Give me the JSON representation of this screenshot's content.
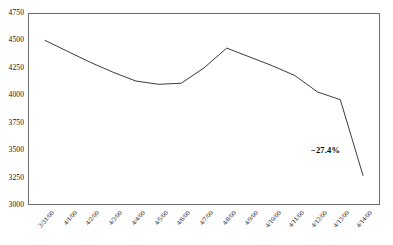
{
  "chart_data": {
    "type": "line",
    "title": "",
    "xlabel": "",
    "ylabel": "",
    "categories": [
      "3/31/00",
      "4/1/00",
      "4/2/00",
      "4/3/00",
      "4/4/00",
      "4/5/00",
      "4/6/00",
      "4/7/00",
      "4/8/00",
      "4/9/00",
      "4/10/00",
      "4/11/00",
      "4/12/00",
      "4/13/00",
      "4/14/00"
    ],
    "values": [
      4500,
      4400,
      4300,
      4210,
      4130,
      4100,
      4110,
      4250,
      4430,
      4350,
      4270,
      4180,
      4030,
      3960,
      3270
    ],
    "series": [
      {
        "name": "Index",
        "values": [
          4500,
          4400,
          4300,
          4210,
          4130,
          4100,
          4110,
          4250,
          4430,
          4350,
          4270,
          4180,
          4030,
          3960,
          3270
        ]
      }
    ],
    "ylim": [
      3000,
      4750
    ],
    "ytick_labels": [
      "4750",
      "4500",
      "4250",
      "4000",
      "3750",
      "3500",
      "3250",
      "3000"
    ],
    "ytick_values": [
      4750,
      4500,
      4250,
      4000,
      3750,
      3500,
      3250,
      3000
    ],
    "grid": false,
    "legend": "none",
    "line_color": "#3b3b3b",
    "annotations": [
      {
        "text": "−27.4%",
        "x_category": "4/12/00",
        "y_value": 3480
      }
    ]
  }
}
